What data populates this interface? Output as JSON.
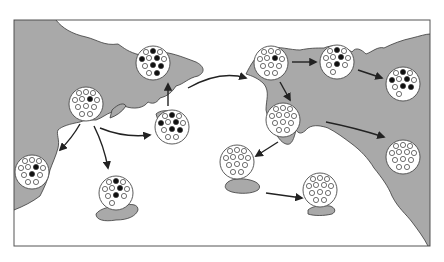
{
  "diagram": {
    "type": "founder-effect-map",
    "colors": {
      "background": "#ffffff",
      "land": "#a9a9a9",
      "land_stroke": "#3a3a3a",
      "frame": "#555555",
      "population_fill": "#ffffff",
      "population_stroke": "#4a4a4a",
      "allele_white": "#ffffff",
      "allele_black": "#111111",
      "arrow": "#222222"
    },
    "frame": {
      "x": 14,
      "y": 20,
      "width": 416,
      "height": 226
    },
    "populations": [
      {
        "id": "origin",
        "cx": 86,
        "cy": 104,
        "r": 17,
        "white": 11,
        "black": 1
      },
      {
        "id": "north-mainland",
        "cx": 153,
        "cy": 63,
        "r": 17,
        "white": 6,
        "black": 6
      },
      {
        "id": "central-island",
        "cx": 172,
        "cy": 127,
        "r": 17,
        "white": 7,
        "black": 5
      },
      {
        "id": "southwest-coast",
        "cx": 32,
        "cy": 172,
        "r": 17,
        "white": 10,
        "black": 2
      },
      {
        "id": "south-island",
        "cx": 116,
        "cy": 193,
        "r": 17,
        "white": 8,
        "black": 3
      },
      {
        "id": "east-landing",
        "cx": 271,
        "cy": 63,
        "r": 17,
        "white": 11,
        "black": 1
      },
      {
        "id": "east-second",
        "cx": 337,
        "cy": 62,
        "r": 17,
        "white": 8,
        "black": 3
      },
      {
        "id": "east-far",
        "cx": 403,
        "cy": 84,
        "r": 17,
        "white": 6,
        "black": 5
      },
      {
        "id": "east-peninsula",
        "cx": 283,
        "cy": 120,
        "r": 17,
        "white": 12,
        "black": 0
      },
      {
        "id": "east-island-1",
        "cx": 237,
        "cy": 162,
        "r": 17,
        "white": 12,
        "black": 0
      },
      {
        "id": "east-island-2",
        "cx": 320,
        "cy": 190,
        "r": 17,
        "white": 12,
        "black": 0
      },
      {
        "id": "east-coast-south",
        "cx": 403,
        "cy": 157,
        "r": 17,
        "white": 12,
        "black": 0
      }
    ],
    "migrations": [
      {
        "from": "origin",
        "to": "southwest-coast",
        "path": "M80,124 Q72,138 60,150"
      },
      {
        "from": "origin",
        "to": "south-island",
        "path": "M94,126 Q104,146 108,168"
      },
      {
        "from": "origin",
        "to": "central-island",
        "path": "M100,128 Q124,138 150,135"
      },
      {
        "from": "central-island",
        "to": "north-mainland",
        "path": "M168,106 L168,84"
      },
      {
        "from": "north-mainland",
        "to": "east-landing",
        "path": "M188,88 Q220,70 246,78"
      },
      {
        "from": "east-landing",
        "to": "east-second",
        "path": "M292,62 L316,62"
      },
      {
        "from": "east-second",
        "to": "east-far",
        "path": "M358,70 L382,78"
      },
      {
        "from": "east-landing",
        "to": "east-peninsula",
        "path": "M280,82 L290,100"
      },
      {
        "from": "east-peninsula",
        "to": "east-coast-south",
        "path": "M326,122 Q356,128 384,137"
      },
      {
        "from": "east-peninsula",
        "to": "east-island-1",
        "path": "M278,142 L256,156"
      },
      {
        "from": "east-island-1",
        "to": "east-island-2",
        "path": "M266,193 L302,198"
      }
    ],
    "legend": null
  }
}
